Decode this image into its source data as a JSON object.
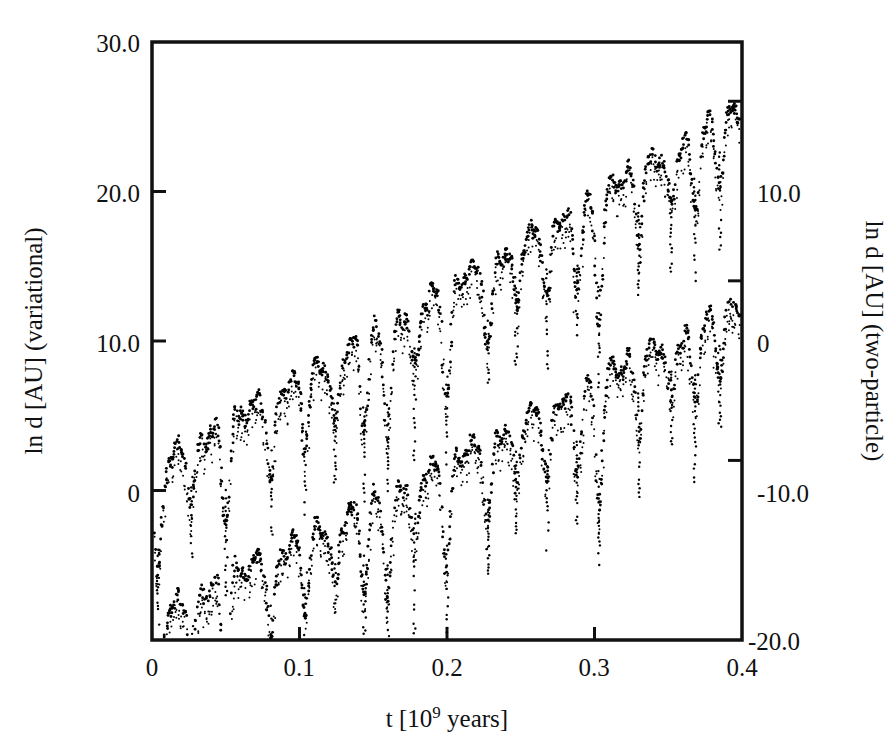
{
  "chart_data": {
    "type": "scatter",
    "title": "",
    "xlabel": "t [10^9 years]",
    "xlabel_base": "t [10",
    "xlabel_exp": "9",
    "xlabel_tail": " years]",
    "ylabel_left": "ln d [AU] (variational)",
    "ylabel_right": "ln d [AU] (two-particle)",
    "xlim": [
      0,
      0.4
    ],
    "ylim_left": [
      -10.0,
      30.0
    ],
    "ylim_right": [
      -20.0,
      13.3
    ],
    "xticks": [
      0,
      0.1,
      0.2,
      0.3,
      0.4
    ],
    "xticklabels": [
      "0",
      "0.1",
      "0.2",
      "0.3",
      "0.4"
    ],
    "yticks_left": [
      0,
      10.0,
      20.0,
      30.0
    ],
    "yticklabels_left": [
      "0",
      "10.0",
      "20.0",
      "30.0"
    ],
    "yticks_right": [
      -20.0,
      -10.0,
      0,
      10.0
    ],
    "yticklabels_right": [
      "-20.0",
      "-10.0",
      "0",
      "10.0"
    ],
    "grid": false,
    "legend": "none",
    "marker_color": "#000000",
    "series": [
      {
        "name": "variational",
        "axis": "left",
        "offset": 0,
        "baseline_start": 2.0,
        "baseline_end": 26.3,
        "spikes_t": [
          0.004,
          0.027,
          0.05,
          0.081,
          0.104,
          0.124,
          0.144,
          0.16,
          0.178,
          0.2,
          0.228,
          0.247,
          0.268,
          0.288,
          0.303,
          0.33,
          0.352,
          0.368,
          0.385
        ],
        "spike_depth": [
          7.5,
          4.0,
          6.5,
          5.5,
          4.5,
          5.0,
          5.5,
          7.0,
          4.5,
          7.5,
          6.0,
          4.0,
          5.0,
          5.5,
          8.0,
          4.5,
          4.0,
          5.0,
          4.0
        ],
        "scatter_spread": 1.1,
        "n_points": 1700
      },
      {
        "name": "two-particle",
        "axis": "right",
        "offset": -11.0,
        "baseline_start": -19.0,
        "baseline_end": 2.2,
        "spikes_t": [
          0.004,
          0.027,
          0.05,
          0.081,
          0.104,
          0.124,
          0.144,
          0.16,
          0.178,
          0.2,
          0.228,
          0.247,
          0.268,
          0.288,
          0.303,
          0.33,
          0.352,
          0.368,
          0.385
        ],
        "spike_depth": [
          7.0,
          4.0,
          6.5,
          5.5,
          4.5,
          5.0,
          5.5,
          7.0,
          4.5,
          7.5,
          6.0,
          4.0,
          5.0,
          5.5,
          8.0,
          4.5,
          4.0,
          5.0,
          4.0
        ],
        "scatter_spread": 1.1,
        "n_points": 1700
      }
    ]
  },
  "axes": {
    "left_label": "ln d [AU] (variational)",
    "right_label": "ln d [AU] (two-particle)",
    "x_tick_0": "0",
    "x_tick_1": "0.1",
    "x_tick_2": "0.2",
    "x_tick_3": "0.3",
    "x_tick_4": "0.4",
    "y_left_0": "30.0",
    "y_left_1": "20.0",
    "y_left_2": "10.0",
    "y_left_3": "0",
    "y_right_0": "10.0",
    "y_right_1": "0",
    "y_right_2": "-10.0",
    "y_right_3": "-20.0",
    "x_label_base": "t [10",
    "x_label_exp": "9",
    "x_label_tail": " years]"
  }
}
